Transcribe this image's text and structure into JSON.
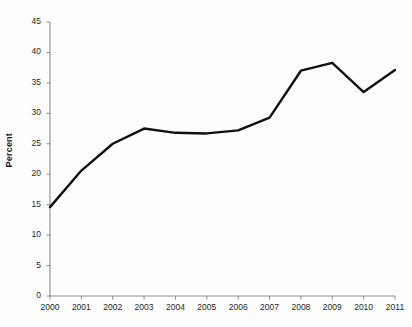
{
  "chart_data": {
    "type": "line",
    "title": "",
    "xlabel": "",
    "ylabel": "Percent",
    "categories": [
      "2000",
      "2001",
      "2002",
      "2003",
      "2004",
      "2005",
      "2006",
      "2007",
      "2008",
      "2009",
      "2010",
      "2011"
    ],
    "values": [
      14.6,
      20.6,
      25.0,
      27.5,
      26.8,
      26.7,
      27.2,
      29.3,
      37.0,
      38.3,
      33.5,
      37.1
    ],
    "series": [
      {
        "name": "Percent",
        "values": [
          14.6,
          20.6,
          25.0,
          27.5,
          26.8,
          26.7,
          27.2,
          29.3,
          37.0,
          38.3,
          33.5,
          37.1
        ],
        "color": "#111111"
      }
    ],
    "ylim": [
      0,
      45
    ],
    "ytick_labels": [
      "0",
      "5",
      "10",
      "15",
      "20",
      "25",
      "30",
      "35",
      "40",
      "45"
    ],
    "ytick_values": [
      0,
      5,
      10,
      15,
      20,
      25,
      30,
      35,
      40,
      45
    ],
    "xtick_labels": [
      "2000",
      "2001",
      "2002",
      "2003",
      "2004",
      "2005",
      "2006",
      "2007",
      "2008",
      "2009",
      "2010",
      "2011"
    ],
    "grid": false,
    "legend": false,
    "legend_position": "none",
    "axis_color": "#8c8c8c",
    "line_color": "#111111",
    "background_color": "#ffffff"
  }
}
